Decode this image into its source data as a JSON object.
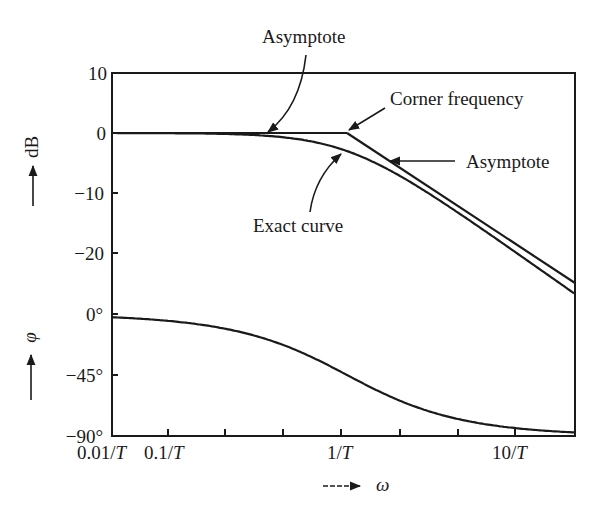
{
  "chart_data": {
    "type": "line",
    "title": "",
    "panels": [
      {
        "name": "magnitude",
        "ylabel": "dB",
        "ylim": [
          -25,
          10
        ],
        "yticks": [
          10,
          0,
          -10,
          -20
        ],
        "ytick_labels": [
          "10",
          "0",
          "−10",
          "−20"
        ],
        "series": [
          {
            "name": "Asymptote (low frequency)",
            "x_wT": [
              0.01,
              1
            ],
            "y_db": [
              0,
              0
            ]
          },
          {
            "name": "Asymptote (high frequency)",
            "x_wT": [
              1,
              22
            ],
            "y_db": [
              0,
              -26.8
            ]
          },
          {
            "name": "Exact curve",
            "formula": "-10*log10(1+(wT)^2)",
            "x_wT": [
              0.01,
              0.1,
              0.3,
              0.5,
              1,
              2,
              3,
              5,
              10,
              22
            ],
            "y_db": [
              0,
              -0.04,
              -0.4,
              -1.0,
              -3.0,
              -7.0,
              -10.0,
              -14.2,
              -20.0,
              -26.9
            ]
          }
        ],
        "annotations": [
          {
            "text": "Asymptote",
            "points_to": "0 dB line near 0.3/T"
          },
          {
            "text": "Corner frequency",
            "points_to": "1/T, 0 dB"
          },
          {
            "text": "Asymptote",
            "points_to": "-20 dB/decade line"
          },
          {
            "text": "Exact curve",
            "points_to": "-3 dB at 1/T"
          }
        ]
      },
      {
        "name": "phase",
        "ylabel": "φ",
        "ylim": [
          -90,
          0
        ],
        "yticks": [
          0,
          -45,
          -90
        ],
        "ytick_labels": [
          "0°",
          "−45°",
          "−90°"
        ],
        "series": [
          {
            "name": "Phase",
            "formula": "-atan(wT)",
            "x_wT": [
              0.01,
              0.1,
              0.3,
              1,
              3,
              10,
              22
            ],
            "y_deg": [
              -0.6,
              -5.7,
              -16.7,
              -45,
              -71.6,
              -84.3,
              -87.4
            ]
          }
        ]
      }
    ],
    "xlabel": "ω",
    "xscale": "log",
    "xtick_labels": [
      "0.01/T",
      "0.1/T",
      "1/T",
      "10/T"
    ],
    "grid": false,
    "legend": "none"
  },
  "labels": {
    "y10": "10",
    "y0": "0",
    "ym10": "−10",
    "ym20": "−20",
    "p0": "0°",
    "p45": "−45°",
    "p90": "−90°",
    "x001": "0.01/",
    "x01": "0.1/",
    "x1": "1/",
    "x10": "10/",
    "T": "T",
    "db": "dB",
    "phi": "φ",
    "omega": "ω",
    "asym1": "Asymptote",
    "corner": "Corner frequency",
    "asym2": "Asymptote",
    "exact": "Exact curve"
  }
}
